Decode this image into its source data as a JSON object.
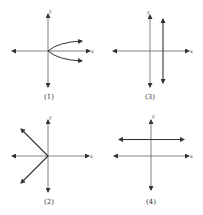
{
  "panels": [
    {
      "id": "1",
      "label": "(1)",
      "x_axis_label": "x",
      "y_axis_label": "y",
      "description": "Sideways parabola opening right from origin"
    },
    {
      "id": "3",
      "label": "(3)",
      "x_axis_label": "x",
      "y_axis_label": "y",
      "description": "Vertical line to the right of the y-axis"
    },
    {
      "id": "2",
      "label": "(2)",
      "x_axis_label": "x",
      "y_axis_label": "y",
      "description": "Two rays from origin going up-left and down-left"
    },
    {
      "id": "4",
      "label": "(4)",
      "x_axis_label": "x",
      "y_axis_label": "y",
      "description": "Horizontal line above the x-axis"
    }
  ],
  "colors": {
    "axis": "#555555",
    "curve": "#333333",
    "background": "#ffffff"
  }
}
